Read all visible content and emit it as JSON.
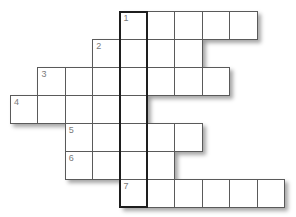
{
  "puzzle": {
    "type": "crossword",
    "grid_origin": {
      "x": 10,
      "y": 11
    },
    "cell_size": {
      "w": 27.4,
      "h": 28
    },
    "colors": {
      "line": "#5a5a5a",
      "highlight_border": "#1e1e1e",
      "number": "#7a7a7a",
      "background": "#ffffff"
    },
    "rows": [
      {
        "number": "1",
        "row": 0,
        "start_col": 4,
        "length": 5
      },
      {
        "number": "2",
        "row": 1,
        "start_col": 3,
        "length": 4
      },
      {
        "number": "3",
        "row": 2,
        "start_col": 1,
        "length": 7
      },
      {
        "number": "4",
        "row": 3,
        "start_col": 0,
        "length": 5
      },
      {
        "number": "5",
        "row": 4,
        "start_col": 2,
        "length": 5
      },
      {
        "number": "6",
        "row": 5,
        "start_col": 2,
        "length": 4
      },
      {
        "number": "7",
        "row": 6,
        "start_col": 4,
        "length": 6
      }
    ],
    "highlighted_column": {
      "col": 4,
      "start_row": 0,
      "length": 7
    }
  }
}
